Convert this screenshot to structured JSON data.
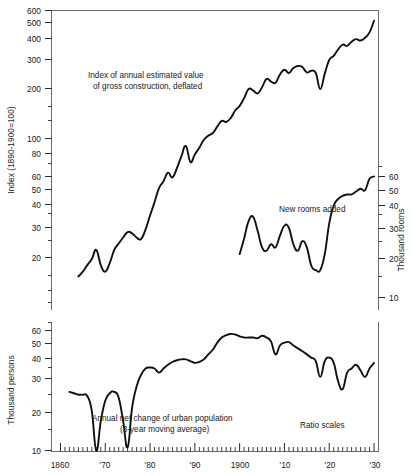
{
  "chart_data": {
    "type": "line",
    "title": "",
    "note": "Ratio scales",
    "xlabel": "",
    "grid": false,
    "legend_position": "inline-annotations",
    "panels": [
      {
        "name": "upper-panel",
        "ylabel_left": "Index (1890-1900=100)",
        "ylabel_right": "Thousand rooms",
        "yscale": "log",
        "ylim_left": [
          14,
          600
        ],
        "ylim_right": [
          7,
          70
        ],
        "yticks_left": [
          20,
          30,
          40,
          50,
          60,
          80,
          100,
          200,
          300,
          400,
          500,
          600
        ],
        "ytick_labels_left": [
          "20",
          "30",
          "40",
          "50",
          "60",
          "80",
          "100",
          "200",
          "300",
          "400",
          "500",
          "600"
        ],
        "yticks_right": [
          10,
          20,
          30,
          40,
          50,
          60
        ],
        "ytick_labels_right": [
          "10",
          "20",
          "30",
          "40",
          "50",
          "60"
        ],
        "series": [
          {
            "name": "Index of annual estimated value of gross construction, deflated",
            "axis": "left",
            "x": [
              1864,
              1865,
              1866,
              1867,
              1868,
              1869,
              1870,
              1871,
              1872,
              1873,
              1874,
              1875,
              1876,
              1877,
              1878,
              1879,
              1880,
              1881,
              1882,
              1883,
              1884,
              1885,
              1886,
              1887,
              1888,
              1889,
              1890,
              1891,
              1892,
              1893,
              1894,
              1895,
              1896,
              1897,
              1898,
              1899,
              1900,
              1901,
              1902,
              1903,
              1904,
              1905,
              1906,
              1907,
              1908,
              1909,
              1910,
              1911,
              1912,
              1913,
              1914,
              1915,
              1916,
              1917,
              1918,
              1919,
              1920,
              1921,
              1922,
              1923,
              1924,
              1925,
              1926,
              1927,
              1928,
              1929,
              1930
            ],
            "y": [
              14.5,
              15.5,
              17,
              18.5,
              21,
              17,
              15.5,
              17.5,
              21,
              23,
              25,
              27,
              26.5,
              25,
              24.5,
              28,
              34,
              41,
              50,
              55,
              62,
              58,
              66,
              78,
              90,
              72,
              80,
              88,
              98,
              104,
              108,
              118,
              128,
              126,
              133,
              148,
              158,
              176,
              200,
              196,
              188,
              205,
              230,
              222,
              218,
              245,
              262,
              250,
              268,
              276,
              272,
              252,
              258,
              250,
              200,
              248,
              300,
              318,
              348,
              372,
              366,
              388,
              402,
              394,
              410,
              442,
              520
            ]
          },
          {
            "name": "New rooms added",
            "axis": "right",
            "x": [
              1900,
              1901,
              1902,
              1903,
              1904,
              1905,
              1906,
              1907,
              1908,
              1909,
              1910,
              1911,
              1912,
              1913,
              1914,
              1915,
              1916,
              1917,
              1918,
              1919,
              1920,
              1921,
              1922,
              1923,
              1924,
              1925,
              1926,
              1927,
              1928,
              1929,
              1930
            ],
            "y": [
              19,
              24,
              31,
              33,
              27,
              21,
              20,
              22,
              21,
              25,
              29,
              28,
              22,
              20,
              23,
              21,
              16,
              15,
              15,
              19,
              30,
              39,
              43,
              45,
              46,
              46,
              48,
              50,
              49,
              58,
              60
            ]
          }
        ]
      },
      {
        "name": "lower-panel",
        "ylabel_left": "Thousand persons",
        "yscale": "log",
        "ylim_left": [
          9.5,
          72
        ],
        "yticks_left": [
          10,
          20,
          30,
          40,
          50,
          60
        ],
        "ytick_labels_left": [
          "10",
          "20",
          "30",
          "40",
          "50",
          "60"
        ],
        "series": [
          {
            "name": "Annual net change of urban population (3-year moving average)",
            "axis": "left",
            "x": [
              1862,
              1863,
              1864,
              1865,
              1866,
              1867,
              1868,
              1869,
              1870,
              1871,
              1872,
              1873,
              1874,
              1875,
              1876,
              1877,
              1878,
              1879,
              1880,
              1881,
              1882,
              1883,
              1884,
              1885,
              1886,
              1887,
              1888,
              1889,
              1890,
              1891,
              1892,
              1893,
              1894,
              1895,
              1896,
              1897,
              1898,
              1899,
              1900,
              1901,
              1902,
              1903,
              1904,
              1905,
              1906,
              1907,
              1908,
              1909,
              1910,
              1911,
              1912,
              1913,
              1914,
              1915,
              1916,
              1917,
              1918,
              1919,
              1920,
              1921,
              1922,
              1923,
              1924,
              1925,
              1926,
              1927,
              1928,
              1929,
              1930
            ],
            "y": [
              24,
              23.5,
              23,
              23,
              22.5,
              18,
              10,
              15.5,
              21,
              23.5,
              24,
              22,
              15.5,
              10.5,
              19,
              26,
              31,
              34,
              34.5,
              34,
              32,
              34,
              36,
              37.5,
              38.5,
              39,
              39,
              38,
              37,
              37.5,
              39,
              42,
              45,
              50,
              54,
              56,
              57,
              56.5,
              55,
              54,
              54,
              54,
              53.5,
              55.5,
              54,
              51,
              42,
              48,
              50,
              50.5,
              48,
              46,
              44,
              42,
              40,
              38,
              30,
              38,
              40,
              37,
              28,
              25,
              32,
              34,
              36,
              33,
              30,
              34,
              37
            ]
          }
        ]
      }
    ],
    "xticks": [
      1860,
      1870,
      1880,
      1890,
      1900,
      1910,
      1920,
      1930
    ],
    "xtick_labels": [
      "1860",
      "'70",
      "'80",
      "'90",
      "1900",
      "'10",
      "'20",
      "'30"
    ],
    "xlim": [
      1858,
      1931
    ],
    "xminor_step": 1
  },
  "labels": {
    "upper_axis_left": "Index (1890-1900=100)",
    "upper_axis_right": "Thousand rooms",
    "lower_axis_left": "Thousand persons",
    "annotation_construction_line1": "Index of annual estimated value",
    "annotation_construction_line2": "of gross construction, deflated",
    "annotation_rooms": "New rooms added",
    "annotation_population_line1": "Annual net change of urban population",
    "annotation_population_line2": "(3-year moving average)",
    "annotation_ratio_scales": "Ratio scales"
  },
  "ticks": {
    "upper_left": [
      "600",
      "500",
      "400",
      "300",
      "200",
      "100",
      "80",
      "60",
      "50",
      "40",
      "30",
      "20"
    ],
    "upper_right": [
      "60",
      "50",
      "40",
      "30",
      "20",
      "10"
    ],
    "lower_left": [
      "60",
      "50",
      "40",
      "30",
      "20",
      "10"
    ],
    "x": [
      "1860",
      "'70",
      "'80",
      "'90",
      "1900",
      "'10",
      "'20",
      "'30"
    ]
  }
}
